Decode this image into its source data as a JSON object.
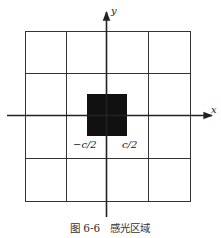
{
  "figure": {
    "caption": "图 6-6   感光区域",
    "axes": {
      "x_label": "x",
      "y_label": "y"
    },
    "ticks": {
      "neg": "−c/2",
      "pos": "c/2"
    },
    "grid": {
      "rows": 4,
      "cols": 4
    },
    "colors": {
      "line": "#222222",
      "fill": "#111111"
    }
  }
}
